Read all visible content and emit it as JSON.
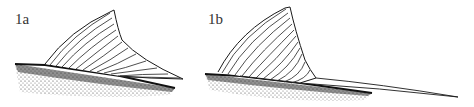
{
  "figure": {
    "panels": [
      {
        "label": "1a",
        "description": "dorsal fin, short rear rays"
      },
      {
        "label": "1b",
        "description": "dorsal fin with elongated trailing filament"
      }
    ],
    "colors": {
      "ink": "#1a1a1a",
      "background": "#ffffff",
      "stipple": "#333333"
    }
  }
}
